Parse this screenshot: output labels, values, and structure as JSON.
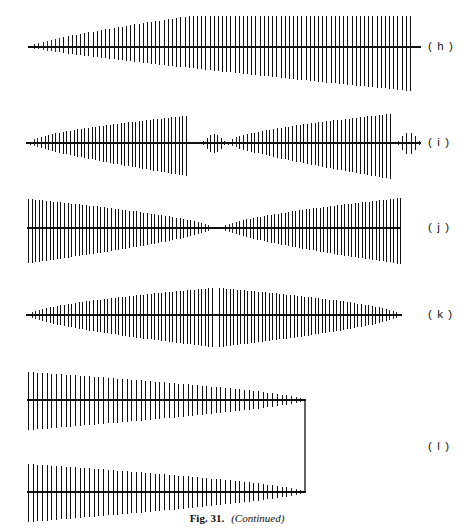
{
  "figure": {
    "caption_label": "Fig. 31.",
    "caption_note": "(Continued)",
    "background_color": "#ffffff",
    "ink_color": "#111111"
  },
  "panels": [
    {
      "id": "h",
      "label": "( h )",
      "label_x": 428,
      "label_y": 40,
      "baseline_y": 47,
      "axis_x0": 30,
      "axis_x1": 421,
      "description": "single burst, amplitude grows from near zero at left to maximum at right, abrupt end"
    },
    {
      "id": "i",
      "label": "( i )",
      "label_x": 428,
      "label_y": 136,
      "baseline_y": 143,
      "axis_x0": 30,
      "axis_x1": 421,
      "description": "two growing bursts separated by a quiet gap, short transient tails at both ends"
    },
    {
      "id": "j",
      "label": "( j )",
      "label_x": 428,
      "label_y": 221,
      "baseline_y": 228,
      "axis_x0": 27,
      "axis_x1": 400,
      "description": "amplitude decays from wide left edge to a node near the middle then grows again to the right"
    },
    {
      "id": "k",
      "label": "( k )",
      "label_x": 428,
      "label_y": 308,
      "baseline_y": 315,
      "axis_x0": 27,
      "axis_x1": 400,
      "description": "amplitude grows to a peak at mid point with a narrow gap then decays to zero at right"
    },
    {
      "id": "l",
      "label": "( l )",
      "label_x": 428,
      "label_y": 440,
      "baseline_y": 400,
      "baseline_y2": 492,
      "axis_x0": 27,
      "axis_x1": 305,
      "bracket_x": 305,
      "description": "two decaying bursts, upper and lower, joined at the right by a rectangular bracket"
    }
  ],
  "chart_data": {
    "type": "line",
    "xlabel": "",
    "ylabel": "",
    "grid": false,
    "legend": "none",
    "series": [
      {
        "name": "h",
        "baseline_y": 47,
        "x_start": 30,
        "x_end": 410,
        "n_lines": 92,
        "envelope_up": [
          1,
          2,
          3,
          4,
          5,
          6,
          8,
          10,
          12,
          14,
          15,
          17,
          18,
          19,
          20,
          21,
          22,
          22,
          23,
          23,
          24,
          24,
          25,
          25,
          26,
          26,
          27,
          27,
          27,
          28,
          28,
          28,
          29,
          29,
          29,
          29,
          30,
          30,
          30,
          30,
          30,
          30,
          31,
          31,
          31,
          31,
          31,
          31,
          31,
          31,
          31,
          31,
          31,
          31,
          31,
          31,
          31,
          31,
          31,
          31,
          31,
          31,
          31,
          31,
          31,
          31,
          31,
          31,
          31,
          31,
          31,
          31,
          31,
          31,
          31,
          31,
          31,
          31,
          31,
          31,
          31,
          31,
          31,
          31,
          31,
          31,
          31,
          31,
          31,
          31,
          31,
          31
        ],
        "envelope_down": [
          1,
          2,
          3,
          4,
          5,
          6,
          7,
          8,
          9,
          10,
          11,
          12,
          12,
          13,
          13,
          14,
          14,
          15,
          15,
          16,
          16,
          17,
          17,
          18,
          18,
          19,
          19,
          20,
          20,
          21,
          21,
          22,
          22,
          23,
          23,
          24,
          24,
          25,
          25,
          26,
          26,
          27,
          27,
          28,
          28,
          29,
          29,
          30,
          30,
          31,
          31,
          32,
          32,
          33,
          33,
          34,
          34,
          35,
          35,
          36,
          36,
          37,
          37,
          38,
          38,
          39,
          39,
          39,
          40,
          40,
          40,
          41,
          41,
          41,
          42,
          42,
          42,
          42,
          43,
          43,
          43,
          43,
          43,
          44,
          44,
          44,
          44,
          44,
          44,
          44,
          44,
          44
        ]
      },
      {
        "name": "i",
        "baseline_y": 143,
        "bursts": [
          {
            "x_start": 30,
            "x_end": 186,
            "n_lines": 44,
            "peak_up": 27,
            "peak_down": 33,
            "shape": "grow"
          },
          {
            "x_start": 203,
            "x_end": 224,
            "n_lines": 7,
            "peak_up": 9,
            "peak_down": 10,
            "shape": "transient"
          },
          {
            "x_start": 228,
            "x_end": 390,
            "n_lines": 44,
            "peak_up": 29,
            "peak_down": 36,
            "shape": "grow"
          },
          {
            "x_start": 398,
            "x_end": 419,
            "n_lines": 6,
            "peak_up": 10,
            "peak_down": 11,
            "shape": "transient"
          }
        ]
      },
      {
        "name": "j",
        "baseline_y": 228,
        "bursts": [
          {
            "x_start": 28,
            "x_end": 212,
            "n_lines": 52,
            "peak_up": 29,
            "peak_down": 35,
            "shape": "decay"
          },
          {
            "x_start": 222,
            "x_end": 400,
            "n_lines": 52,
            "peak_up": 30,
            "peak_down": 36,
            "shape": "grow"
          }
        ]
      },
      {
        "name": "k",
        "baseline_y": 315,
        "bursts": [
          {
            "x_start": 28,
            "x_end": 212,
            "n_lines": 52,
            "peak_up": 27,
            "peak_down": 32,
            "shape": "grow"
          },
          {
            "x_start": 219,
            "x_end": 400,
            "n_lines": 52,
            "peak_up": 27,
            "peak_down": 32,
            "shape": "decay"
          }
        ]
      },
      {
        "name": "l-upper",
        "baseline_y": 400,
        "x_start": 28,
        "x_end": 305,
        "n_lines": 60,
        "peak_up": 28,
        "peak_down": 30,
        "shape": "decay"
      },
      {
        "name": "l-lower",
        "baseline_y": 492,
        "x_start": 28,
        "x_end": 305,
        "n_lines": 60,
        "peak_up": 28,
        "peak_down": 30,
        "shape": "decay"
      }
    ]
  }
}
